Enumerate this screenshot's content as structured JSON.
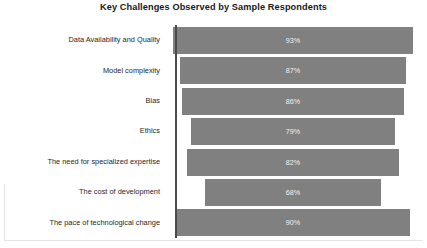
{
  "chart_data": {
    "type": "bar",
    "orientation": "horizontal",
    "title": "Key Challenges Observed by Sample Respondents",
    "xlabel": "",
    "ylabel": "",
    "grid": false,
    "legend": false,
    "xlim": [
      0,
      100
    ],
    "value_suffix": "%",
    "categories": [
      "Data Availability and Quality",
      "Model complexity",
      "Bias",
      "Ethics",
      "The need for specialized expertise",
      "The cost of development",
      "The pace of technological change"
    ],
    "values": [
      93,
      87,
      86,
      79,
      82,
      68,
      90
    ],
    "value_labels": [
      "93%",
      "87%",
      "86%",
      "79%",
      "82%",
      "68%",
      "90%"
    ],
    "bar_color": "#808080",
    "value_label_color": "#f2f2f2",
    "axis_line_color": "#4a4a4a",
    "title_color": "#1a1a1a",
    "background_color": "#ffffff"
  }
}
